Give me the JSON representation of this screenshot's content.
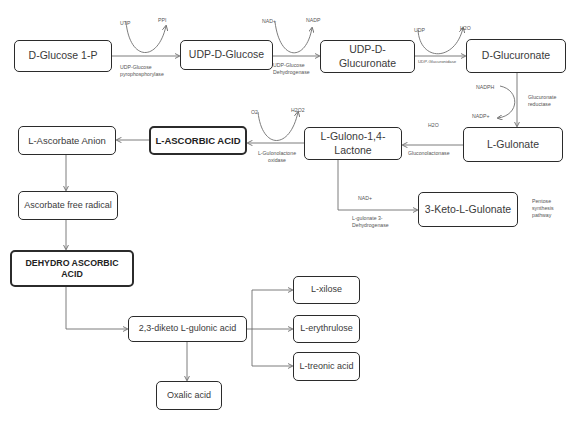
{
  "diagram": {
    "nodes": {
      "d_glucose_1p": "D-Glucose 1-P",
      "udp_d_glucose": "UDP-D-Glucose",
      "udp_d_glucuronate": "UDP-D-Glucuronate",
      "d_glucuronate": "D-Glucuronate",
      "l_gulonate": "L-Gulonate",
      "l_gulono_lactone": "L-Gulono-1,4-Lactone",
      "l_ascorbic_acid": "L-ASCORBIC ACID",
      "l_ascorbate_anion": "L-Ascorbate Anion",
      "ascorbate_free_radical": "Ascorbate free radical",
      "dehydro_ascorbic_acid": "DEHYDRO ASCORBIC ACID",
      "keto_gulonate": "3-Keto-L-Gulonate",
      "diketo_gulonic": "2,3-diketo L-gulonic acid",
      "oxalic_acid": "Oxalic acid",
      "l_xilose": "L-xilose",
      "l_erythrulose": "L-erythrulose",
      "l_treonic_acid": "L-treonic acid"
    },
    "cofactors": {
      "utp": "UTP",
      "ppi": "PPI",
      "nad_plus_1": "NAD+",
      "nadp": "NADP",
      "udp": "UDP",
      "h2o_1": "H2O",
      "nadph": "NADPH",
      "nadp_plus": "NADP+",
      "h2o_2": "H2O",
      "o2": "O2",
      "h2o2": "H2O2",
      "nad_plus_2": "NAD+"
    },
    "enzymes": {
      "udp_glucose_pyrophosphorylase": "UDP-Glucose pyrophosphorylase",
      "udp_glucose_dehydrogenase": "UDP-Glucose Dehydrogenase",
      "udp_glucuronidase": "UDP-Glucuronidase",
      "glucuronate_reductase": "Glucuronate reductase",
      "gluconolactonase": "Gluconolactonase",
      "l_gulonolactone_oxidase": "L-Gulonolactone oxidase",
      "l_gulonate_3_dehydrogenase": "L-gulonate 3-Dehydrogenase"
    },
    "annotations": {
      "pentose_pathway": "Pentose synthesis pathway"
    },
    "colors": {
      "box_border": "#2b2b2b",
      "arrow": "#6e6e6e",
      "text": "#3a3a3a"
    }
  }
}
